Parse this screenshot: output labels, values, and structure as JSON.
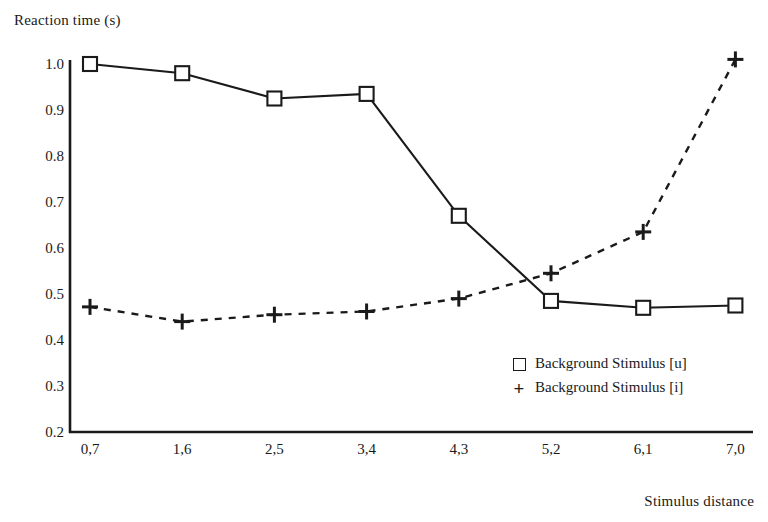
{
  "chart_data": {
    "type": "line",
    "title": "",
    "xlabel": "Stimulus distance",
    "ylabel": "Reaction time (s)",
    "categories": [
      "0,7",
      "1,6",
      "2,5",
      "3,4",
      "4,3",
      "5,2",
      "6,1",
      "7,0"
    ],
    "x_numeric": [
      0.7,
      1.6,
      2.5,
      3.4,
      4.3,
      5.2,
      6.1,
      7.0
    ],
    "ylim": [
      0.2,
      1.0
    ],
    "ytick_labels": [
      "1.0",
      "0.9",
      "0.8",
      "0.7",
      "0.6",
      "0.5",
      "0.4",
      "0.3",
      "0.2"
    ],
    "ytick_values": [
      1.0,
      0.9,
      0.8,
      0.7,
      0.6,
      0.5,
      0.4,
      0.3,
      0.2
    ],
    "grid": false,
    "legend_position": "inside lower-right",
    "series": [
      {
        "name": "Background Stimulus [u]",
        "marker": "open-square",
        "line_style": "solid",
        "color": "#1a1a1a",
        "values": [
          1.0,
          0.98,
          0.925,
          0.935,
          0.67,
          0.485,
          0.47,
          0.475
        ]
      },
      {
        "name": "Background Stimulus [i]",
        "marker": "plus",
        "line_style": "dashed",
        "color": "#1a1a1a",
        "values": [
          0.472,
          0.44,
          0.455,
          0.462,
          0.49,
          0.545,
          0.635,
          1.01
        ]
      }
    ]
  },
  "axes": {
    "y_axis_color": "#1a1a1a",
    "x_axis_color": "#1a1a1a"
  }
}
